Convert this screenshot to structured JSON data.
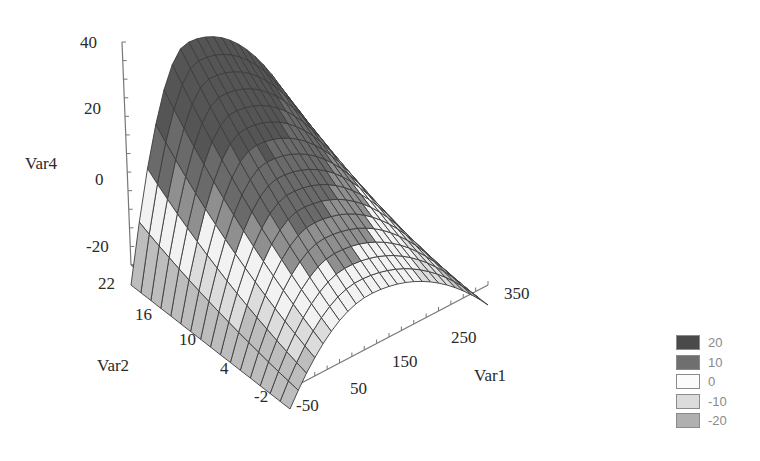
{
  "chart_data": {
    "type": "surface3d",
    "title": "",
    "axes": {
      "x": {
        "label": "Var1",
        "ticks": [
          -50,
          50,
          150,
          250,
          350
        ],
        "range": [
          -50,
          350
        ]
      },
      "y": {
        "label": "Var2",
        "ticks": [
          -2,
          4,
          10,
          16,
          22
        ],
        "range": [
          -2,
          22
        ]
      },
      "z": {
        "label": "Var4",
        "ticks": [
          -20,
          0,
          20,
          40
        ],
        "range": [
          -20,
          40
        ]
      }
    },
    "surface": {
      "description": "Concave-down saddle-like ridge: Var4 peaks (~35-38) near Var1≈50-100 at high Var2, falls to about -20 at Var1=-50 and at Var1=350, and decreases toward low Var2.",
      "grid": {
        "var1_steps": 24,
        "var2_steps": 16
      },
      "sample_points": [
        {
          "Var1": -50,
          "Var2": 22,
          "Var4": -20
        },
        {
          "Var1": 50,
          "Var2": 22,
          "Var4": 36
        },
        {
          "Var1": 150,
          "Var2": 22,
          "Var4": 34
        },
        {
          "Var1": 350,
          "Var2": 22,
          "Var4": -18
        },
        {
          "Var1": -50,
          "Var2": -2,
          "Var4": -20
        },
        {
          "Var1": 150,
          "Var2": -2,
          "Var4": 5
        },
        {
          "Var1": 350,
          "Var2": -2,
          "Var4": -20
        }
      ]
    },
    "legend": {
      "position": "bottom-right",
      "entries": [
        {
          "label": "20",
          "color": "#4a4a4a"
        },
        {
          "label": "10",
          "color": "#6f6f6f"
        },
        {
          "label": "0",
          "color": "#fbfbfb"
        },
        {
          "label": "-10",
          "color": "#dcdcdc"
        },
        {
          "label": "-20",
          "color": "#b0b0b0"
        }
      ]
    },
    "grid": false
  },
  "labels": {
    "z_title": "Var4",
    "y_title": "Var2",
    "x_title": "Var1",
    "z_ticks": [
      "40",
      "20",
      "0",
      "-20"
    ],
    "y_ticks": [
      "22",
      "16",
      "10",
      "4",
      "-2"
    ],
    "x_ticks": [
      "-50",
      "50",
      "150",
      "250",
      "350"
    ]
  },
  "legend": {
    "items": [
      {
        "label": "20",
        "color": "#4a4a4a"
      },
      {
        "label": "10",
        "color": "#6f6f6f"
      },
      {
        "label": "0",
        "color": "#fbfbfb"
      },
      {
        "label": "-10",
        "color": "#dcdcdc"
      },
      {
        "label": "-20",
        "color": "#b0b0b0"
      }
    ]
  }
}
